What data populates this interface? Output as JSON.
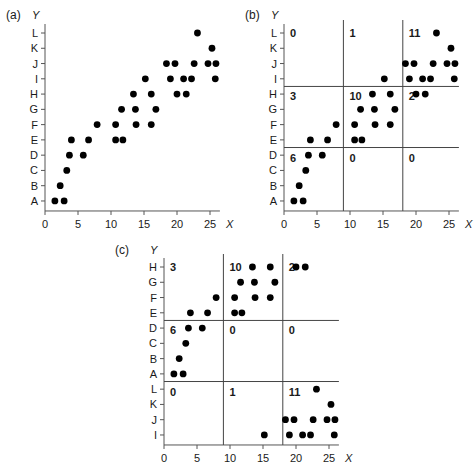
{
  "chart_data": [
    {
      "panel": "(a)",
      "type": "scatter",
      "xlabel": "X",
      "ylabel": "Y",
      "xticks": [
        0,
        5,
        10,
        15,
        20,
        25
      ],
      "xlim": [
        0,
        26.5
      ],
      "y_categories": [
        "A",
        "B",
        "C",
        "D",
        "E",
        "F",
        "G",
        "H",
        "I",
        "J",
        "K",
        "L"
      ],
      "points": [
        {
          "x": 1.5,
          "y": "A"
        },
        {
          "x": 2.9,
          "y": "A"
        },
        {
          "x": 2.3,
          "y": "B"
        },
        {
          "x": 3.3,
          "y": "C"
        },
        {
          "x": 3.7,
          "y": "D"
        },
        {
          "x": 5.8,
          "y": "D"
        },
        {
          "x": 4.0,
          "y": "E"
        },
        {
          "x": 6.6,
          "y": "E"
        },
        {
          "x": 10.7,
          "y": "E"
        },
        {
          "x": 11.8,
          "y": "E"
        },
        {
          "x": 7.9,
          "y": "F"
        },
        {
          "x": 10.7,
          "y": "F"
        },
        {
          "x": 13.8,
          "y": "F"
        },
        {
          "x": 16.1,
          "y": "F"
        },
        {
          "x": 11.6,
          "y": "G"
        },
        {
          "x": 13.7,
          "y": "G"
        },
        {
          "x": 16.8,
          "y": "G"
        },
        {
          "x": 13.4,
          "y": "H"
        },
        {
          "x": 16.1,
          "y": "H"
        },
        {
          "x": 20.0,
          "y": "H"
        },
        {
          "x": 21.4,
          "y": "H"
        },
        {
          "x": 15.2,
          "y": "I"
        },
        {
          "x": 19.0,
          "y": "I"
        },
        {
          "x": 21.0,
          "y": "I"
        },
        {
          "x": 22.2,
          "y": "I"
        },
        {
          "x": 25.8,
          "y": "I"
        },
        {
          "x": 18.4,
          "y": "J"
        },
        {
          "x": 19.7,
          "y": "J"
        },
        {
          "x": 22.6,
          "y": "J"
        },
        {
          "x": 24.7,
          "y": "J"
        },
        {
          "x": 25.9,
          "y": "J"
        },
        {
          "x": 25.3,
          "y": "K"
        },
        {
          "x": 23.1,
          "y": "L"
        }
      ]
    },
    {
      "panel": "(b)",
      "type": "scatter",
      "xlabel": "X",
      "ylabel": "Y",
      "xticks": [
        0,
        5,
        10,
        15,
        20,
        25
      ],
      "xlim": [
        0,
        26.5
      ],
      "y_categories": [
        "A",
        "B",
        "C",
        "D",
        "E",
        "F",
        "G",
        "H",
        "I",
        "J",
        "K",
        "L"
      ],
      "x_splits": [
        9,
        18
      ],
      "y_splits": [
        "D|E",
        "H|I"
      ],
      "cell_counts": [
        {
          "row": "top",
          "col": "left",
          "count": "0"
        },
        {
          "row": "top",
          "col": "middle",
          "count": "1"
        },
        {
          "row": "top",
          "col": "right",
          "count": "11"
        },
        {
          "row": "middle",
          "col": "left",
          "count": "3"
        },
        {
          "row": "middle",
          "col": "middle",
          "count": "10"
        },
        {
          "row": "middle",
          "col": "right",
          "count": "2"
        },
        {
          "row": "bottom",
          "col": "left",
          "count": "6"
        },
        {
          "row": "bottom",
          "col": "middle",
          "count": "0"
        },
        {
          "row": "bottom",
          "col": "right",
          "count": "0"
        }
      ],
      "points_same_as": "(a)"
    },
    {
      "panel": "(c)",
      "type": "scatter",
      "xlabel": "X",
      "ylabel": "Y",
      "xticks": [
        0,
        5,
        10,
        15,
        20,
        25
      ],
      "xlim": [
        0,
        26.5
      ],
      "y_categories_top_to_bottom": [
        "H",
        "G",
        "F",
        "E",
        "D",
        "C",
        "B",
        "A",
        "L",
        "K",
        "J",
        "I"
      ],
      "x_splits": [
        9,
        18
      ],
      "y_splits": [
        "E|D",
        "A|L"
      ],
      "cell_counts": [
        {
          "row": "top",
          "col": "left",
          "count": "3"
        },
        {
          "row": "top",
          "col": "middle",
          "count": "10"
        },
        {
          "row": "top",
          "col": "right",
          "count": "2"
        },
        {
          "row": "middle",
          "col": "left",
          "count": "6"
        },
        {
          "row": "middle",
          "col": "middle",
          "count": "0"
        },
        {
          "row": "middle",
          "col": "right",
          "count": "0"
        },
        {
          "row": "bottom",
          "col": "left",
          "count": "0"
        },
        {
          "row": "bottom",
          "col": "middle",
          "count": "1"
        },
        {
          "row": "bottom",
          "col": "right",
          "count": "11"
        }
      ],
      "points_same_as": "(a)"
    }
  ],
  "labels": {
    "panel_a": "(a)",
    "panel_b": "(b)",
    "panel_c": "(c)",
    "x_axis": "X",
    "y_axis": "Y"
  }
}
